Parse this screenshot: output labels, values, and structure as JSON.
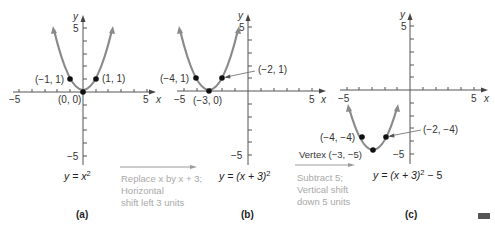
{
  "panels": [
    {
      "id": "a",
      "caption": "(a)",
      "equation_lhs": "y = x",
      "equation_sup": "2",
      "equation_tail": "",
      "axis": {
        "x_label": "x",
        "y_label": "y",
        "x_min_label": "−5",
        "x_max_label": "5",
        "y_max_label": "5",
        "y_min_label": "−5"
      },
      "points": [
        {
          "label": "(−1, 1)",
          "x": -1,
          "y": 1
        },
        {
          "label": "(1, 1)",
          "x": 1,
          "y": 1
        },
        {
          "label": "(0, 0)",
          "x": 0,
          "y": 0
        }
      ]
    },
    {
      "id": "b",
      "caption": "(b)",
      "equation_lhs": "y = (x + 3)",
      "equation_sup": "2",
      "equation_tail": "",
      "axis": {
        "x_label": "x",
        "y_label": "y",
        "x_min_label": "−5",
        "x_max_label": "5",
        "y_max_label": "5",
        "y_min_label": "−5"
      },
      "points": [
        {
          "label": "(−4, 1)",
          "x": -4,
          "y": 1
        },
        {
          "label": "(−2, 1)",
          "x": -2,
          "y": 1
        },
        {
          "label": "(−3, 0)",
          "x": -3,
          "y": 0
        }
      ]
    },
    {
      "id": "c",
      "caption": "(c)",
      "equation_lhs": "y = (x + 3)",
      "equation_sup": "2",
      "equation_tail": " − 5",
      "axis": {
        "x_label": "x",
        "y_label": "y",
        "x_min_label": "−5",
        "x_max_label": "5",
        "y_max_label": "5",
        "y_min_label": "−5"
      },
      "points": [
        {
          "label": "(−4, −4)",
          "x": -4,
          "y": -4
        },
        {
          "label": "(−2, −4)",
          "x": -2,
          "y": -4
        },
        {
          "label": "Vertex (−3, −5)",
          "x": -3,
          "y": -5
        }
      ]
    }
  ],
  "transforms": [
    {
      "lines": [
        "Replace x by x + 3;",
        "Horizontal",
        "shift left 3 units"
      ]
    },
    {
      "lines": [
        "Subtract 5;",
        "Vertical shift",
        "down 5 units"
      ]
    }
  ],
  "colors": {
    "curve": "#8a8a8a",
    "axis": "#555555",
    "point": "#111111",
    "note": "#a8a8a8"
  }
}
